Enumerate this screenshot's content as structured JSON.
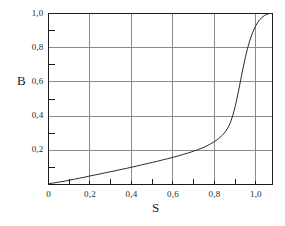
{
  "figure": {
    "background_color": "#ffffff",
    "frame_color": "#1a1a1a",
    "grid_color": "#8a8a8a",
    "curve_color": "#2b2b2b"
  },
  "chart_data": {
    "type": "line",
    "title": "",
    "subtitle": "",
    "xlabel": "S",
    "ylabel": "B",
    "xlim": [
      0,
      1.08
    ],
    "ylim": [
      0,
      1.0
    ],
    "grid": true,
    "grid_axes": "both",
    "legend": null,
    "legend_position": "none",
    "decimal_separator": ",",
    "x_ticks": [
      0,
      0.2,
      0.4,
      0.6,
      0.8,
      1.0
    ],
    "x_tick_labels": [
      "0",
      "0,2",
      "0,4",
      "0,6",
      "0,8",
      "1,0"
    ],
    "x_minor_ticks": [
      0.1,
      0.3,
      0.5,
      0.7,
      0.9
    ],
    "y_ticks": [
      0.2,
      0.4,
      0.6,
      0.8,
      1.0
    ],
    "y_tick_labels": [
      "0,2",
      "0,4",
      "0,6",
      "0,8",
      "1,0"
    ],
    "y_minor_ticks": [
      0.1,
      0.3,
      0.5,
      0.7,
      0.9
    ],
    "series": [
      {
        "name": "B(S)",
        "color": "#2b2b2b",
        "line_width": 1,
        "points": [
          [
            0.0,
            0.005
          ],
          [
            0.025,
            0.009
          ],
          [
            0.05,
            0.014
          ],
          [
            0.075,
            0.019
          ],
          [
            0.1,
            0.025
          ],
          [
            0.125,
            0.031
          ],
          [
            0.15,
            0.037
          ],
          [
            0.175,
            0.043
          ],
          [
            0.2,
            0.05
          ],
          [
            0.225,
            0.056
          ],
          [
            0.25,
            0.062
          ],
          [
            0.275,
            0.069
          ],
          [
            0.3,
            0.075
          ],
          [
            0.325,
            0.081
          ],
          [
            0.35,
            0.088
          ],
          [
            0.375,
            0.094
          ],
          [
            0.4,
            0.101
          ],
          [
            0.425,
            0.108
          ],
          [
            0.45,
            0.115
          ],
          [
            0.475,
            0.122
          ],
          [
            0.5,
            0.129
          ],
          [
            0.525,
            0.136
          ],
          [
            0.55,
            0.144
          ],
          [
            0.575,
            0.151
          ],
          [
            0.6,
            0.159
          ],
          [
            0.625,
            0.167
          ],
          [
            0.65,
            0.176
          ],
          [
            0.675,
            0.185
          ],
          [
            0.7,
            0.195
          ],
          [
            0.725,
            0.206
          ],
          [
            0.75,
            0.218
          ],
          [
            0.775,
            0.233
          ],
          [
            0.8,
            0.251
          ],
          [
            0.82,
            0.268
          ],
          [
            0.84,
            0.29
          ],
          [
            0.855,
            0.312
          ],
          [
            0.87,
            0.343
          ],
          [
            0.88,
            0.372
          ],
          [
            0.89,
            0.41
          ],
          [
            0.9,
            0.456
          ],
          [
            0.91,
            0.51
          ],
          [
            0.92,
            0.57
          ],
          [
            0.93,
            0.632
          ],
          [
            0.94,
            0.693
          ],
          [
            0.95,
            0.748
          ],
          [
            0.96,
            0.797
          ],
          [
            0.97,
            0.84
          ],
          [
            0.98,
            0.875
          ],
          [
            0.99,
            0.905
          ],
          [
            1.0,
            0.93
          ],
          [
            1.01,
            0.95
          ],
          [
            1.02,
            0.966
          ],
          [
            1.03,
            0.978
          ],
          [
            1.04,
            0.987
          ],
          [
            1.05,
            0.994
          ],
          [
            1.06,
            0.998
          ],
          [
            1.07,
            1.0
          ]
        ]
      }
    ]
  }
}
